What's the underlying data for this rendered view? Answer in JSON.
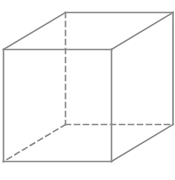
{
  "diagram": {
    "type": "wireframe-cube",
    "stroke_color": "#8a8a8a",
    "background": "#ffffff",
    "vertices": {
      "front_top_left": [
        3.5,
        49.5
      ],
      "front_top_right": [
        111.5,
        49.5
      ],
      "front_bottom_left": [
        3.5,
        161.5
      ],
      "front_bottom_right": [
        111.5,
        161.5
      ],
      "back_top_left": [
        65.5,
        12.5
      ],
      "back_top_right": [
        173,
        12.5
      ],
      "back_bottom_left": [
        65.5,
        124.5
      ],
      "back_bottom_right": [
        173,
        124.5
      ]
    },
    "solid_edges": [
      [
        "front_top_left",
        "front_top_right"
      ],
      [
        "front_top_right",
        "front_bottom_right"
      ],
      [
        "front_bottom_right",
        "front_bottom_left"
      ],
      [
        "front_bottom_left",
        "front_top_left"
      ],
      [
        "front_top_left",
        "back_top_left"
      ],
      [
        "back_top_left",
        "back_top_right"
      ],
      [
        "front_top_right",
        "back_top_right"
      ],
      [
        "back_top_right",
        "back_bottom_right"
      ],
      [
        "front_bottom_right",
        "back_bottom_right"
      ]
    ],
    "dashed_edges": [
      [
        "back_top_left",
        "back_bottom_left"
      ],
      [
        "back_bottom_left",
        "back_bottom_right"
      ],
      [
        "back_bottom_left",
        "front_bottom_left"
      ]
    ]
  }
}
